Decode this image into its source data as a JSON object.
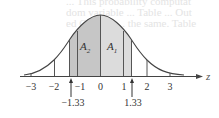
{
  "figure": {
    "ghost_text": [
      "... This probability computat",
      "dom variable ... Table ... Out",
      "ed Chapter ... the same. Table"
    ],
    "axis_label": "z",
    "ticks": [
      "−3",
      "−2",
      "−1",
      "0",
      "1",
      "2",
      "3"
    ],
    "areas": [
      {
        "name": "A",
        "sub": "2",
        "from": -1.33,
        "to": 0,
        "color": "#c6c6c6"
      },
      {
        "name": "A",
        "sub": "1",
        "from": 0,
        "to": 1.33,
        "color": "#dcdcdc"
      }
    ],
    "markers": [
      {
        "label": "−1.33",
        "value": -1.33
      },
      {
        "label": "1.33",
        "value": 1.33
      }
    ]
  }
}
